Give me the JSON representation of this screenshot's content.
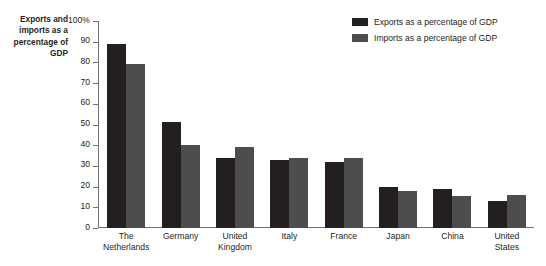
{
  "chart_data": {
    "type": "bar",
    "title": "Exports and imports as a percentage of GDP",
    "xlabel": "",
    "ylabel": "Exports and imports as a percentage of GDP",
    "ylim": [
      0,
      100
    ],
    "grid": false,
    "legend_position": "top-right",
    "y_ticks": [
      "0",
      "10",
      "20",
      "30",
      "40",
      "50",
      "60",
      "70",
      "80",
      "90",
      "100%"
    ],
    "y_tick_values": [
      0,
      10,
      20,
      30,
      40,
      50,
      60,
      70,
      80,
      90,
      100
    ],
    "categories": [
      "The Netherlands",
      "Germany",
      "United Kingdom",
      "Italy",
      "France",
      "Japan",
      "China",
      "United States"
    ],
    "category_lines": [
      [
        "The",
        "Netherlands"
      ],
      [
        "Germany"
      ],
      [
        "United",
        "Kingdom"
      ],
      [
        "Italy"
      ],
      [
        "France"
      ],
      [
        "Japan"
      ],
      [
        "China"
      ],
      [
        "United",
        "States"
      ]
    ],
    "series": [
      {
        "name": "Exports as a percentage of GDP",
        "color": "#231f20",
        "values": [
          89,
          51,
          34,
          33,
          32,
          20,
          19,
          13
        ]
      },
      {
        "name": "Imports as a percentage of GDP",
        "color": "#4d4d4f",
        "values": [
          79,
          40,
          39,
          34,
          34,
          18,
          15.5,
          16
        ]
      }
    ]
  },
  "axis_title": {
    "lines": [
      "Exports and",
      "imports as a",
      "percentage of",
      "GDP"
    ]
  },
  "colors": {
    "exports": "#231f20",
    "imports": "#4d4d4f",
    "axis": "#6f7276",
    "text": "#231f20",
    "background": "#ffffff"
  }
}
